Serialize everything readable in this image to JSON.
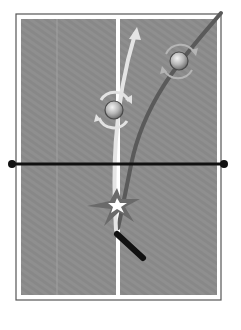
{
  "diagram": {
    "table": {
      "outline_color": "#555555",
      "border_color": "#ffffff",
      "surface_color": "#8e8e8e",
      "center_line_color": "#ffffff"
    },
    "net": {
      "color": "#111111"
    },
    "trajectories": [
      {
        "name": "dark-curve-trajectory",
        "color": "#5a5a5a"
      },
      {
        "name": "light-curve-trajectory",
        "color": "#e6e6e6"
      }
    ],
    "balls": [
      {
        "name": "ball-with-sidespin",
        "spin": "sidespin"
      },
      {
        "name": "ball-with-sidespin-light",
        "spin": "sidespin"
      }
    ],
    "impact": {
      "name": "impact-burst",
      "color": "#6a6a6a"
    },
    "paddle": {
      "name": "paddle",
      "color": "#111111"
    }
  }
}
